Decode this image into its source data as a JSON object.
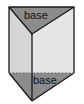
{
  "diagram": {
    "type": "triangular-prism",
    "labels": {
      "top_base": "base",
      "bottom_base": "base"
    },
    "colors": {
      "base_face": "#8c8c8c",
      "left_face": "#d6d6d6",
      "right_face": "#e6e6e6",
      "edge": "#1a1a1a",
      "background": "#ffffff"
    }
  }
}
